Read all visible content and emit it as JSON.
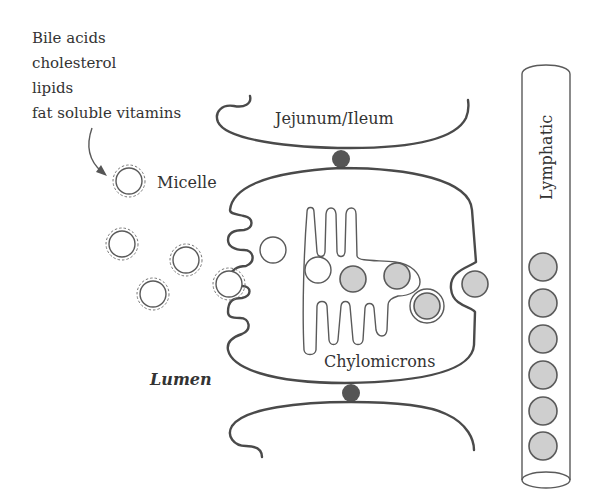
{
  "labels": {
    "inputs_list": [
      "Bile acids",
      "cholesterol",
      "lipids",
      "fat soluble vitamins"
    ],
    "micelle": "Micelle",
    "jejunum": "Jejunum/Ileum",
    "lymphatic": "Lymphatic",
    "lumen": "Lumen",
    "chylomicrons": "Chylomicrons"
  },
  "colors": {
    "outline": "#4a4a4a",
    "chylomicron_fill": "#cfcfcf",
    "junction": "#555555",
    "text": "#333333"
  },
  "counts": {
    "lumen_micelles": 6,
    "chylomicrons_in_cell": 3,
    "chylomicrons_in_lymphatic": 6
  }
}
